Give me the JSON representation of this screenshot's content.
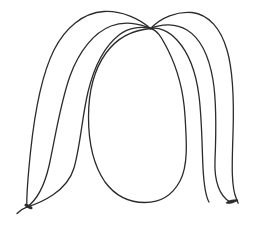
{
  "image": {
    "title": "Hand-drawn line sketch of a head with long hair",
    "subject": "face-with-hair",
    "style": "single-color ink line drawing",
    "width": 257,
    "height": 227
  },
  "canvas": {
    "background_color": "#ffffff",
    "stroke_color": "#2b2b2b",
    "stroke_width": 1.3,
    "view_box": "0 0 257 227"
  },
  "anchors": {
    "crown_label": "crown-convergence-point",
    "crown_x": 150,
    "crown_y": 28,
    "left_tip_label": "left-hair-tip",
    "left_tip_x": 27,
    "left_tip_y": 207,
    "right_tip_label": "right-hair-tip",
    "right_tip_x": 238,
    "right_tip_y": 203
  },
  "strokes": [
    {
      "name": "hair-strand-left-outer",
      "side": "left",
      "order": 1,
      "d": "M150.5,28.5 C140,19 122,10.5 104,11.5 C83,12.7 65,28 54,50 C42,74 34.5,114 30.5,152 C28,176 26.5,195 26.8,207.2"
    },
    {
      "name": "hair-strand-left-middle",
      "side": "left",
      "order": 2,
      "d": "M150.5,28.5 C139,23 124,21 111,26 C94,32.5 79,51 70,76 C60.5,102.5 55.5,136 49,166 C42.5,194 32,203.5 26.8,207.2"
    },
    {
      "name": "hair-strand-left-inner",
      "side": "left",
      "order": 3,
      "d": "M150.5,28.5 C140,26 128,28 119,35 C105,46 94,67 88,92 C82,117 80.5,145 74,168 C67,192 40,203 26.8,207.2"
    },
    {
      "name": "face-outline-oval",
      "side": "center",
      "order": 4,
      "d": "M150.5,28.5 C133,30 117,38 106,53 C94.5,69 88.5,92 88.5,117 C88.5,143 94,166 105,182 C116,197 131,202.5 145,202.5 C159,202.5 172,196 180,181 C188.5,165 186.5,140 185,116 C183.5,90 176,66 168,50 C161,36 157,30 150.5,28.5"
    },
    {
      "name": "hair-strand-right-inner",
      "side": "right",
      "order": 5,
      "d": "M150.5,28.5 C159,27 169,31 177,40 C188,52 196,72 199,96 C202,120 202,148 203,168 C204,186 206,197 209,202"
    },
    {
      "name": "hair-strand-right-middle",
      "side": "right",
      "order": 6,
      "d": "M150.5,28.5 C162,23.5 176,23.5 187,30 C200,38 209,56 213,80 C217,104 216,136 215,160 C214,182 220,196 229.5,201.5"
    },
    {
      "name": "hair-strand-right-outer",
      "side": "right",
      "order": 7,
      "d": "M150.5,28.5 C161,17.5 177,11 192,12.5 C209,14.5 221,29 227,50 C233.5,72 234,104 233,134 C232,164 231,187 236.5,199 C237.5,201.5 238,202.7 238.2,203.2"
    },
    {
      "name": "hair-tip-left-flick",
      "side": "left",
      "order": 8,
      "d": "M26.8,207.2 C23,208.5 19.5,211 17,213.5"
    }
  ],
  "tips": [
    {
      "name": "left-tip-blob",
      "cx": 28.5,
      "cy": 206.5,
      "rx": 4.5,
      "ry": 1.6,
      "rotate": 28
    },
    {
      "name": "right-tip-blob",
      "cx": 232,
      "cy": 201.5,
      "rx": 6.5,
      "ry": 1.7,
      "rotate": -14
    }
  ]
}
